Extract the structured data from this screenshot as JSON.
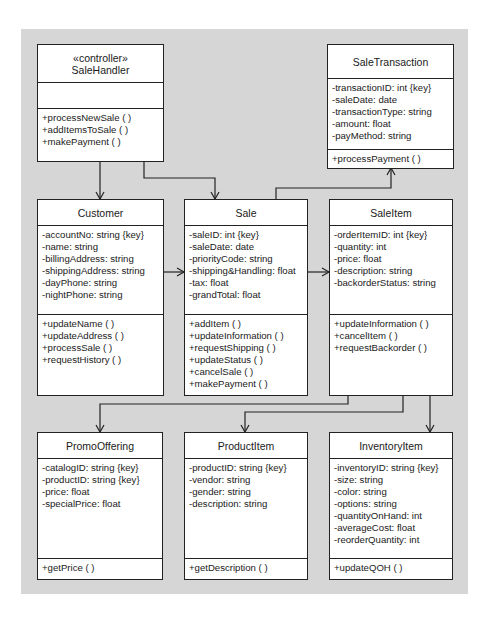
{
  "diagram": {
    "type": "UML class diagram",
    "background_color": "#d6d6d6",
    "classes": {
      "sale_handler": {
        "stereotype": "«controller»",
        "name": "SaleHandler",
        "attributes": [],
        "operations": [
          "+processNewSale ( )",
          "+addItemsToSale ( )",
          "+makePayment ( )"
        ]
      },
      "sale_transaction": {
        "name": "SaleTransaction",
        "attributes": [
          "-transactionID: int {key}",
          "-saleDate: date",
          "-transactionType: string",
          "-amount: float",
          "-payMethod: string"
        ],
        "operations": [
          "+processPayment ( )"
        ]
      },
      "customer": {
        "name": "Customer",
        "attributes": [
          "-accountNo: string {key}",
          "-name: string",
          "-billingAddress: string",
          "-shippingAddress: string",
          "-dayPhone: string",
          "-nightPhone: string"
        ],
        "operations": [
          "+updateName ( )",
          "+updateAddress ( )",
          "+processSale ( )",
          "+requestHistory ( )"
        ]
      },
      "sale": {
        "name": "Sale",
        "attributes": [
          "-saleID: int {key}",
          "-saleDate: date",
          "-priorityCode: string",
          "-shipping&Handling: float",
          "-tax: float",
          "-grandTotal: float"
        ],
        "operations": [
          "+addItem ( )",
          "+updateInformation ( )",
          "+requestShipping ( )",
          "+updateStatus ( )",
          "+cancelSale ( )",
          "+makePayment ( )"
        ]
      },
      "sale_item": {
        "name": "SaleItem",
        "attributes": [
          "-orderItemID: int {key}",
          "-quantity: int",
          "-price: float",
          "-description: string",
          "-backorderStatus: string"
        ],
        "operations": [
          "+updateInformation ( )",
          "+cancelItem ( )",
          "+requestBackorder ( )"
        ]
      },
      "promo_offering": {
        "name": "PromoOffering",
        "attributes": [
          "-catalogID: string {key}",
          "-productID: string {key}",
          "-price: float",
          "-specialPrice: float"
        ],
        "operations": [
          "+getPrice ( )"
        ]
      },
      "product_item": {
        "name": "ProductItem",
        "attributes": [
          "-productID: string {key}",
          "-vendor: string",
          "-gender: string",
          "-description: string"
        ],
        "operations": [
          "+getDescription ( )"
        ]
      },
      "inventory_item": {
        "name": "InventoryItem",
        "attributes": [
          "-inventoryID: string {key}",
          "-size: string",
          "-color: string",
          "-options: string",
          "-quantityOnHand: int",
          "-averageCost: float",
          "-reorderQuantity: int"
        ],
        "operations": [
          "+updateQOH ( )"
        ]
      }
    },
    "associations": [
      {
        "from": "SaleHandler",
        "to": "Customer"
      },
      {
        "from": "SaleHandler",
        "to": "Sale"
      },
      {
        "from": "Sale",
        "to": "SaleTransaction"
      },
      {
        "from": "Customer",
        "to": "Sale"
      },
      {
        "from": "Sale",
        "to": "SaleItem"
      },
      {
        "from": "SaleItem",
        "to": "PromoOffering"
      },
      {
        "from": "SaleItem",
        "to": "ProductItem"
      },
      {
        "from": "SaleItem",
        "to": "InventoryItem"
      }
    ]
  }
}
